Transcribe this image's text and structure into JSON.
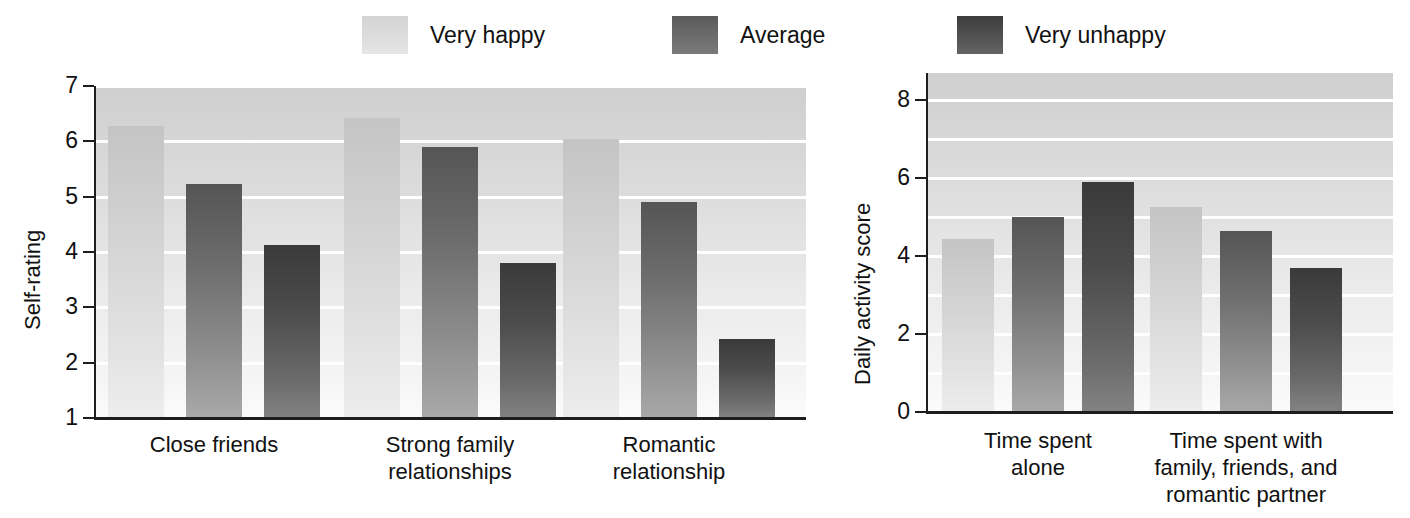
{
  "legend": {
    "items": [
      {
        "label": "Very happy",
        "series_key": "s0",
        "color": "#d2d2d2"
      },
      {
        "label": "Average",
        "series_key": "s1",
        "color": "#6d6d6d"
      },
      {
        "label": "Very unhappy",
        "series_key": "s2",
        "color": "#4c4c4c"
      }
    ]
  },
  "chart_data": [
    {
      "id": "self-rating-chart",
      "type": "bar",
      "title": "",
      "xlabel": "",
      "ylabel": "Self-rating",
      "ylim": [
        1,
        7
      ],
      "yticks": [
        1,
        2,
        3,
        4,
        5,
        6,
        7
      ],
      "ytick_labels": [
        "1",
        "2",
        "3",
        "4",
        "5",
        "6",
        "7"
      ],
      "grid": true,
      "legend_position": "top",
      "categories": [
        "Close friends",
        "Strong family relationships",
        "Romantic relationship"
      ],
      "category_lines": [
        [
          "Close friends"
        ],
        [
          "Strong family",
          "relationships"
        ],
        [
          "Romantic",
          "relationship"
        ]
      ],
      "series": [
        {
          "name": "Very happy",
          "values": [
            6.28,
            6.42,
            6.05
          ]
        },
        {
          "name": "Average",
          "values": [
            5.23,
            5.9,
            4.9
          ]
        },
        {
          "name": "Very unhappy",
          "values": [
            4.13,
            3.8,
            2.42
          ]
        }
      ]
    },
    {
      "id": "daily-activity-chart",
      "type": "bar",
      "title": "",
      "xlabel": "",
      "ylabel": "Daily activity score",
      "ylim": [
        0,
        8.7
      ],
      "yticks": [
        0,
        2,
        4,
        6,
        8
      ],
      "ytick_labels": [
        "0",
        "2",
        "4",
        "6",
        "8"
      ],
      "gridlines_at": [
        1,
        2,
        3,
        4,
        5,
        6,
        7,
        8
      ],
      "grid": true,
      "legend_position": "top",
      "categories": [
        "Time spent alone",
        "Time spent with family, friends, and romantic partner"
      ],
      "category_lines": [
        [
          "Time spent",
          "alone"
        ],
        [
          "Time spent with",
          "family, friends, and",
          "romantic partner"
        ]
      ],
      "series": [
        {
          "name": "Very happy",
          "values": [
            4.45,
            5.25
          ]
        },
        {
          "name": "Average",
          "values": [
            5.0,
            4.65
          ]
        },
        {
          "name": "Very unhappy",
          "values": [
            5.9,
            3.7
          ]
        }
      ]
    }
  ]
}
